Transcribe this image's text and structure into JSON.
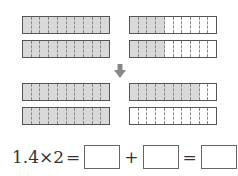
{
  "colors": {
    "shade": "#d9d9d9",
    "border": "#555555",
    "arrow": "#888888"
  },
  "diagram": {
    "columns_per_bar": 10,
    "top": {
      "left": [
        {
          "shaded": 10
        },
        {
          "shaded": 10
        }
      ],
      "right": [
        {
          "shaded": 4
        },
        {
          "shaded": 4
        }
      ]
    },
    "arrow": "down-arrow",
    "bottom": {
      "left": [
        {
          "shaded": 10
        },
        {
          "shaded": 10
        }
      ],
      "right": [
        {
          "shaded": 8
        },
        {
          "shaded": 0
        }
      ]
    }
  },
  "equation": {
    "lhs": "1.4×2",
    "eq1": "=",
    "plus": "+",
    "eq2": "=",
    "blanks": [
      "",
      "",
      ""
    ]
  }
}
